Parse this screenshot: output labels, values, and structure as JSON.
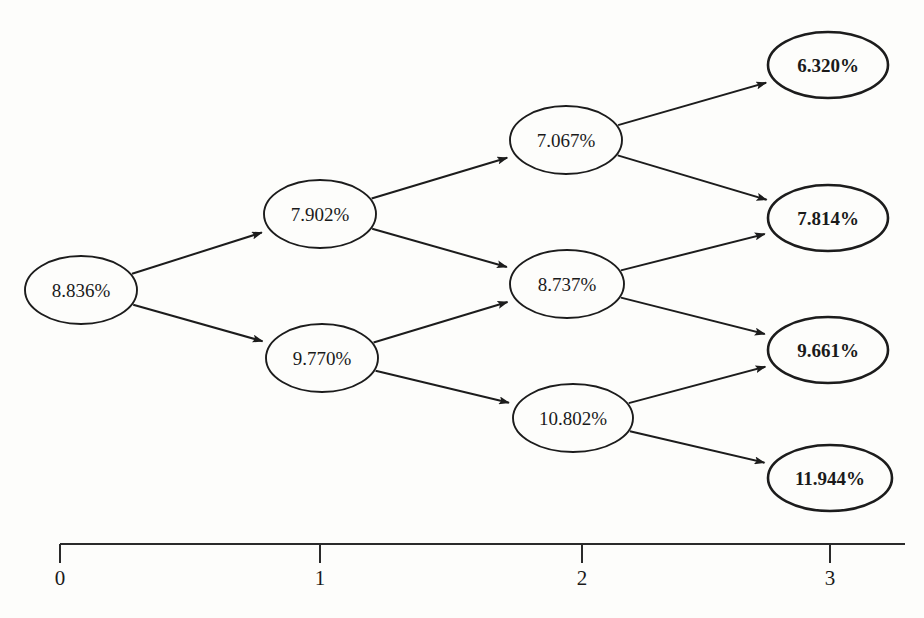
{
  "diagram": {
    "kind": "recombining-binomial-tree",
    "ink_color": "#1c1c1c",
    "background_color": "#fdfdfb"
  },
  "nodes": [
    {
      "id": "n0",
      "label": "8.836%",
      "step": 0,
      "cx": 81,
      "cy": 290,
      "rx": 56,
      "ry": 34,
      "emphasis": "normal"
    },
    {
      "id": "n1u",
      "label": "7.902%",
      "step": 1,
      "cx": 320,
      "cy": 214,
      "rx": 56,
      "ry": 34,
      "emphasis": "normal"
    },
    {
      "id": "n1d",
      "label": "9.770%",
      "step": 1,
      "cx": 322,
      "cy": 358,
      "rx": 56,
      "ry": 34,
      "emphasis": "normal"
    },
    {
      "id": "n2uu",
      "label": "7.067%",
      "step": 2,
      "cx": 566,
      "cy": 140,
      "rx": 56,
      "ry": 34,
      "emphasis": "normal"
    },
    {
      "id": "n2ud",
      "label": "8.737%",
      "step": 2,
      "cx": 567,
      "cy": 284,
      "rx": 57,
      "ry": 34,
      "emphasis": "normal"
    },
    {
      "id": "n2dd",
      "label": "10.802%",
      "step": 2,
      "cx": 573,
      "cy": 418,
      "rx": 60,
      "ry": 34,
      "emphasis": "normal"
    },
    {
      "id": "n3a",
      "label": "6.320%",
      "step": 3,
      "cx": 828,
      "cy": 65,
      "rx": 60,
      "ry": 33,
      "emphasis": "bold"
    },
    {
      "id": "n3b",
      "label": "7.814%",
      "step": 3,
      "cx": 828,
      "cy": 218,
      "rx": 60,
      "ry": 33,
      "emphasis": "bold"
    },
    {
      "id": "n3c",
      "label": "9.661%",
      "step": 3,
      "cx": 828,
      "cy": 350,
      "rx": 60,
      "ry": 33,
      "emphasis": "bold"
    },
    {
      "id": "n3d",
      "label": "11.944%",
      "step": 3,
      "cx": 830,
      "cy": 478,
      "rx": 62,
      "ry": 33,
      "emphasis": "bold"
    }
  ],
  "edges": [
    {
      "from": "n0",
      "to": "n1u"
    },
    {
      "from": "n0",
      "to": "n1d"
    },
    {
      "from": "n1u",
      "to": "n2uu"
    },
    {
      "from": "n1u",
      "to": "n2ud"
    },
    {
      "from": "n1d",
      "to": "n2ud"
    },
    {
      "from": "n1d",
      "to": "n2dd"
    },
    {
      "from": "n2uu",
      "to": "n3a"
    },
    {
      "from": "n2uu",
      "to": "n3b"
    },
    {
      "from": "n2ud",
      "to": "n3b"
    },
    {
      "from": "n2ud",
      "to": "n3c"
    },
    {
      "from": "n2dd",
      "to": "n3c"
    },
    {
      "from": "n2dd",
      "to": "n3d"
    }
  ],
  "axis": {
    "y": 544,
    "x_start": 60,
    "x_end": 905,
    "tick_length": 19,
    "label_y": 585,
    "ticks": [
      {
        "label": "0",
        "x": 60
      },
      {
        "label": "1",
        "x": 320
      },
      {
        "label": "2",
        "x": 582
      },
      {
        "label": "3",
        "x": 830
      }
    ]
  }
}
